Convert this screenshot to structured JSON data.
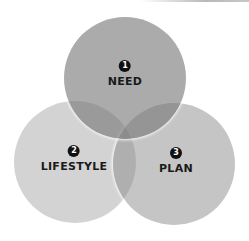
{
  "diagram": {
    "type": "venn",
    "sets": [
      {
        "number": "1",
        "label": "NEED",
        "position": "top"
      },
      {
        "number": "2",
        "label": "LIFESTYLE",
        "position": "bottom-left"
      },
      {
        "number": "3",
        "label": "PLAN",
        "position": "bottom-right"
      }
    ],
    "colors": {
      "circle_fill": "#9a9a9a",
      "overlap_fill": "#6e6e6e",
      "badge": "#111111",
      "text": "#1a1a1a",
      "background": "#ffffff"
    }
  }
}
